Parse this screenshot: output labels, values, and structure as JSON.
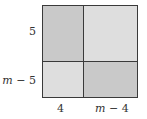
{
  "diagram": {
    "colors": {
      "border": "#3a3a3a",
      "dark_fill": "#c9c9c9",
      "light_fill": "#dedede"
    },
    "regions": [
      {
        "id": "top-left",
        "width_label": "4",
        "height_label": "5",
        "fill": "#c9c9c9"
      },
      {
        "id": "top-right",
        "width_label": "m − 4",
        "height_label": "5",
        "fill": "#dedede"
      },
      {
        "id": "bottom-left",
        "width_label": "4",
        "height_label": "m − 5",
        "fill": "#dedede"
      },
      {
        "id": "bottom-right",
        "width_label": "m − 4",
        "height_label": "m − 5",
        "fill": "#c9c9c9"
      }
    ],
    "labels": {
      "left_top": "5",
      "left_bottom": "m − 5",
      "bottom_left": "4",
      "bottom_right": "m − 4"
    }
  }
}
